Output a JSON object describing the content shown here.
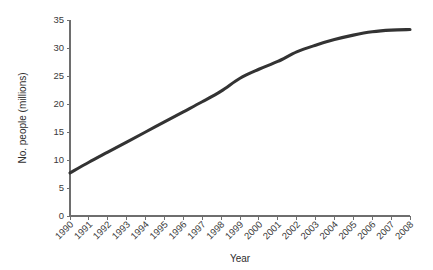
{
  "chart_data": {
    "type": "line",
    "title": "",
    "xlabel": "Year",
    "ylabel": "No. people (millions)",
    "x": [
      1990,
      1991,
      1992,
      1993,
      1994,
      1995,
      1996,
      1997,
      1998,
      1999,
      2000,
      2001,
      2002,
      2003,
      2004,
      2005,
      2006,
      2007,
      2008
    ],
    "categories": [
      "1990",
      "1991",
      "1992",
      "1993",
      "1994",
      "1995",
      "1996",
      "1997",
      "1998",
      "1999",
      "2000",
      "2001",
      "2002",
      "2003",
      "2004",
      "2005",
      "2006",
      "2007",
      "2008"
    ],
    "values": [
      7.7,
      9.6,
      11.4,
      13.2,
      15.0,
      16.8,
      18.6,
      20.4,
      22.3,
      24.6,
      26.2,
      27.6,
      29.3,
      30.5,
      31.5,
      32.3,
      32.9,
      33.2,
      33.3
    ],
    "series": [
      {
        "name": "No. people (millions)",
        "values": [
          7.7,
          9.6,
          11.4,
          13.2,
          15.0,
          16.8,
          18.6,
          20.4,
          22.3,
          24.6,
          26.2,
          27.6,
          29.3,
          30.5,
          31.5,
          32.3,
          32.9,
          33.2,
          33.3
        ],
        "color": "#333333"
      }
    ],
    "ylim": [
      0,
      35
    ],
    "yticks": [
      0,
      5,
      10,
      15,
      20,
      25,
      30,
      35
    ],
    "ytick_labels": [
      "0",
      "5",
      "10",
      "15",
      "20",
      "25",
      "30",
      "35"
    ],
    "xlim": [
      1990,
      2008
    ],
    "grid": false,
    "legend": false,
    "legend_position": "none",
    "xtick_rotation": 45,
    "line_color": "#333333",
    "axis_color": "#6e6e6e",
    "background_color": "#ffffff"
  }
}
